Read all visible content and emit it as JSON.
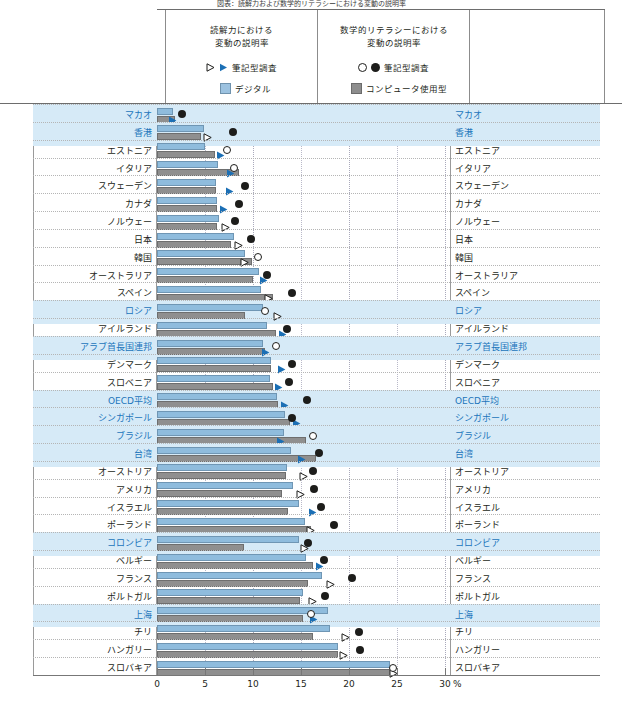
{
  "top_title": "図表：読解力および数学的リテラシーにおける変動の説明率",
  "legend": {
    "reading": {
      "heading_line1": "読解力における",
      "heading_line2": "変動の説明率",
      "paper_label": "筆記型調査",
      "digital_label": "デジタル"
    },
    "math": {
      "heading_line1": "数学的リテラシーにおける",
      "heading_line2": "変動の説明率",
      "paper_label": "筆記型調査",
      "computer_label": "コンピュータ使用型"
    }
  },
  "axis": {
    "ticks": [
      0,
      5,
      10,
      15,
      20,
      25,
      30
    ],
    "tick_labels": [
      "0",
      "5",
      "10",
      "15",
      "20",
      "25",
      "30"
    ],
    "unit": "%",
    "xlim": [
      0,
      30.5
    ]
  },
  "colors": {
    "bar_blue": "#8fbcdd",
    "bar_gray": "#8f8f8f",
    "marker_blue": "#1b6fb5",
    "marker_black": "#1d1d1b",
    "highlight_label": "#1b75bb",
    "highlight_row": "#d6eaf7"
  },
  "chart_data": {
    "type": "bar",
    "title": "図表：読解力および数学的リテラシーにおける変動の説明率",
    "xlabel": "%",
    "ylabel": "",
    "xlim": [
      0,
      30.5
    ],
    "grid": true,
    "legend_position": "top",
    "orientation": "horizontal",
    "series_names": [
      "読解力 デジタル",
      "数学的リテラシー コンピュータ使用型",
      "読解力 筆記型調査",
      "数学的リテラシー 筆記型調査"
    ],
    "categories": [
      "マカオ",
      "香港",
      "エストニア",
      "イタリア",
      "スウェーデン",
      "カナダ",
      "ノルウェー",
      "日本",
      "韓国",
      "オーストラリア",
      "スペイン",
      "ロシア",
      "アイルランド",
      "アラブ首長国連邦",
      "デンマーク",
      "スロベニア",
      "OECD平均",
      "シンガポール",
      "ブラジル",
      "台湾",
      "オーストリア",
      "アメリカ",
      "イスラエル",
      "ポーランド",
      "コロンビア",
      "ベルギー",
      "フランス",
      "ポルトガル",
      "上海",
      "チリ",
      "ハンガリー",
      "スロバキア"
    ],
    "highlighted_categories": [
      "マカオ",
      "香港",
      "ロシア",
      "アラブ首長国連邦",
      "OECD平均",
      "シンガポール",
      "ブラジル",
      "台湾",
      "コロンビア",
      "上海"
    ],
    "rows": [
      {
        "name": "マカオ",
        "reading_digital": 1.7,
        "math_computer": 1.9,
        "reading_paper": 1.6,
        "reading_paper_filled": true,
        "math_paper": 2.6,
        "math_paper_filled": true,
        "highlight": true
      },
      {
        "name": "香港",
        "reading_digital": 4.9,
        "math_computer": 4.6,
        "reading_paper": 5.3,
        "reading_paper_filled": false,
        "math_paper": 7.9,
        "math_paper_filled": true,
        "highlight": true
      },
      {
        "name": "エストニア",
        "reading_digital": 5.0,
        "math_computer": 6.0,
        "reading_paper": 6.6,
        "reading_paper_filled": true,
        "math_paper": 7.3,
        "math_paper_filled": false,
        "highlight": false
      },
      {
        "name": "イタリア",
        "reading_digital": 6.4,
        "math_computer": 8.5,
        "reading_paper": 7.7,
        "reading_paper_filled": true,
        "math_paper": 8.0,
        "math_paper_filled": false,
        "highlight": false
      },
      {
        "name": "スウェーデン",
        "reading_digital": 6.1,
        "math_computer": 6.1,
        "reading_paper": 7.5,
        "reading_paper_filled": true,
        "math_paper": 9.2,
        "math_paper_filled": true,
        "highlight": false
      },
      {
        "name": "カナダ",
        "reading_digital": 6.3,
        "math_computer": 6.3,
        "reading_paper": 6.9,
        "reading_paper_filled": true,
        "math_paper": 8.5,
        "math_paper_filled": true,
        "highlight": false
      },
      {
        "name": "ノルウェー",
        "reading_digital": 6.5,
        "math_computer": 6.3,
        "reading_paper": 7.1,
        "reading_paper_filled": false,
        "math_paper": 8.1,
        "math_paper_filled": true,
        "highlight": false
      },
      {
        "name": "日本",
        "reading_digital": 8.0,
        "math_computer": 7.7,
        "reading_paper": 8.5,
        "reading_paper_filled": false,
        "math_paper": 9.8,
        "math_paper_filled": true,
        "highlight": false
      },
      {
        "name": "韓国",
        "reading_digital": 9.2,
        "math_computer": 9.9,
        "reading_paper": 9.1,
        "reading_paper_filled": false,
        "math_paper": 10.5,
        "math_paper_filled": false,
        "highlight": false
      },
      {
        "name": "オーストラリア",
        "reading_digital": 10.6,
        "math_computer": 10.0,
        "reading_paper": 11.1,
        "reading_paper_filled": true,
        "math_paper": 11.5,
        "math_paper_filled": true,
        "highlight": false
      },
      {
        "name": "スペイン",
        "reading_digital": 10.8,
        "math_computer": 12.1,
        "reading_paper": 11.6,
        "reading_paper_filled": false,
        "math_paper": 14.1,
        "math_paper_filled": true,
        "highlight": false
      },
      {
        "name": "ロシア",
        "reading_digital": 11.0,
        "math_computer": 9.2,
        "reading_paper": 12.6,
        "reading_paper_filled": false,
        "math_paper": 11.3,
        "math_paper_filled": false,
        "highlight": true
      },
      {
        "name": "アイルランド",
        "reading_digital": 11.5,
        "math_computer": 12.4,
        "reading_paper": 13.1,
        "reading_paper_filled": true,
        "math_paper": 13.5,
        "math_paper_filled": true,
        "highlight": false
      },
      {
        "name": "アラブ首長国連邦",
        "reading_digital": 11.0,
        "math_computer": 11.2,
        "reading_paper": 11.3,
        "reading_paper_filled": true,
        "math_paper": 12.4,
        "math_paper_filled": false,
        "highlight": true
      },
      {
        "name": "デンマーク",
        "reading_digital": 11.9,
        "math_computer": 11.9,
        "reading_paper": 13.0,
        "reading_paper_filled": true,
        "math_paper": 14.1,
        "math_paper_filled": true,
        "highlight": false
      },
      {
        "name": "スロベニア",
        "reading_digital": 11.8,
        "math_computer": 12.1,
        "reading_paper": 12.7,
        "reading_paper_filled": true,
        "math_paper": 13.8,
        "math_paper_filled": true,
        "highlight": false
      },
      {
        "name": "OECD平均",
        "reading_digital": 12.5,
        "math_computer": 12.6,
        "reading_paper": 13.3,
        "reading_paper_filled": true,
        "math_paper": 15.6,
        "math_paper_filled": true,
        "highlight": true
      },
      {
        "name": "シンガポール",
        "reading_digital": 13.3,
        "math_computer": 13.9,
        "reading_paper": 14.5,
        "reading_paper_filled": true,
        "math_paper": 14.1,
        "math_paper_filled": true,
        "highlight": true
      },
      {
        "name": "ブラジル",
        "reading_digital": 13.2,
        "math_computer": 15.5,
        "reading_paper": 12.9,
        "reading_paper_filled": true,
        "math_paper": 16.2,
        "math_paper_filled": false,
        "highlight": true
      },
      {
        "name": "台湾",
        "reading_digital": 14.0,
        "math_computer": 16.6,
        "reading_paper": 15.0,
        "reading_paper_filled": true,
        "math_paper": 16.9,
        "math_paper_filled": true,
        "highlight": true
      },
      {
        "name": "オーストリア",
        "reading_digital": 13.5,
        "math_computer": 13.4,
        "reading_paper": 15.3,
        "reading_paper_filled": false,
        "math_paper": 16.2,
        "math_paper_filled": true,
        "highlight": false
      },
      {
        "name": "アメリカ",
        "reading_digital": 14.2,
        "math_computer": 13.0,
        "reading_paper": 14.9,
        "reading_paper_filled": false,
        "math_paper": 16.4,
        "math_paper_filled": true,
        "highlight": false
      },
      {
        "name": "イスラエル",
        "reading_digital": 14.8,
        "math_computer": 13.6,
        "reading_paper": 16.2,
        "reading_paper_filled": true,
        "math_paper": 17.1,
        "math_paper_filled": true,
        "highlight": false
      },
      {
        "name": "ポーランド",
        "reading_digital": 15.4,
        "math_computer": 16.0,
        "reading_paper": 16.0,
        "reading_paper_filled": false,
        "math_paper": 18.4,
        "math_paper_filled": true,
        "highlight": false
      },
      {
        "name": "コロンビア",
        "reading_digital": 14.8,
        "math_computer": 9.1,
        "reading_paper": 15.4,
        "reading_paper_filled": false,
        "math_paper": 15.7,
        "math_paper_filled": true,
        "highlight": true
      },
      {
        "name": "ベルギー",
        "reading_digital": 15.5,
        "math_computer": 16.2,
        "reading_paper": 16.9,
        "reading_paper_filled": true,
        "math_paper": 17.4,
        "math_paper_filled": true,
        "highlight": false
      },
      {
        "name": "フランス",
        "reading_digital": 17.2,
        "math_computer": 15.7,
        "reading_paper": 18.1,
        "reading_paper_filled": false,
        "math_paper": 20.3,
        "math_paper_filled": true,
        "highlight": false
      },
      {
        "name": "ポルトガル",
        "reading_digital": 15.2,
        "math_computer": 14.9,
        "reading_paper": 16.2,
        "reading_paper_filled": false,
        "math_paper": 17.5,
        "math_paper_filled": true,
        "highlight": false
      },
      {
        "name": "上海",
        "reading_digital": 17.8,
        "math_computer": 15.2,
        "reading_paper": 16.3,
        "reading_paper_filled": true,
        "math_paper": 16.0,
        "math_paper_filled": false,
        "highlight": true
      },
      {
        "name": "チリ",
        "reading_digital": 18.0,
        "math_computer": 16.3,
        "reading_paper": 19.6,
        "reading_paper_filled": false,
        "math_paper": 21.0,
        "math_paper_filled": true,
        "highlight": false
      },
      {
        "name": "ハンガリー",
        "reading_digital": 18.9,
        "math_computer": 18.9,
        "reading_paper": 19.4,
        "reading_paper_filled": false,
        "math_paper": 21.1,
        "math_paper_filled": true,
        "highlight": false
      },
      {
        "name": "スロバキア",
        "reading_digital": 24.3,
        "math_computer": 24.5,
        "reading_paper": 24.6,
        "reading_paper_filled": false,
        "math_paper": 24.6,
        "math_paper_filled": false,
        "highlight": false
      }
    ]
  }
}
